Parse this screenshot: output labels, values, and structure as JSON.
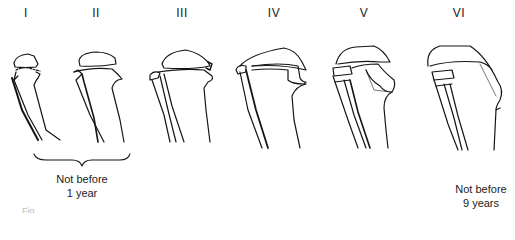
{
  "figure": {
    "stages": [
      {
        "numeral": "I",
        "x": 26
      },
      {
        "numeral": "II",
        "x": 96
      },
      {
        "numeral": "III",
        "x": 182
      },
      {
        "numeral": "IV",
        "x": 274
      },
      {
        "numeral": "V",
        "x": 364
      },
      {
        "numeral": "VI",
        "x": 459
      }
    ],
    "annotations": {
      "group_1_2": {
        "line1": "Not before",
        "line2": "1 year"
      },
      "stage_6": {
        "line1": "Not before",
        "line2": "9 years"
      }
    },
    "caption_fragment": "Fig. ..."
  }
}
